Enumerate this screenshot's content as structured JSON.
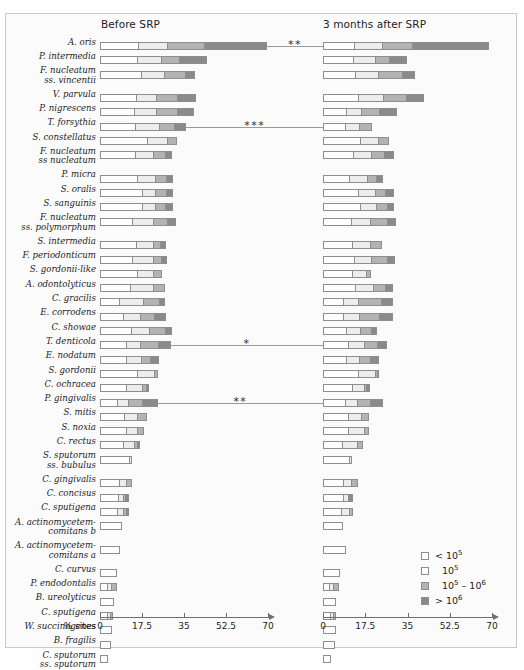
{
  "panels": {
    "before": {
      "title": "Before SRP"
    },
    "after": {
      "title": "3 months after SRP"
    }
  },
  "axis": {
    "caption": "% sites",
    "ticks": [
      "0",
      "17.5",
      "35",
      "52.5",
      "70"
    ],
    "min": 0,
    "max": 70
  },
  "legend": {
    "items": [
      {
        "name": "lt-10e5",
        "swatch": "#ffffff",
        "prefix": "<",
        "base": "10",
        "exp": "5"
      },
      {
        "name": "10e5",
        "swatch": "#ffffff",
        "prefix": "",
        "base": "10",
        "exp": "5"
      },
      {
        "name": "10e5-10e6",
        "swatch": "#b3b3b3",
        "prefix": "",
        "base": "10",
        "exp": "5",
        "base2": "10",
        "exp2": "6",
        "dash": "–"
      },
      {
        "name": "gt-10e6",
        "swatch": "#8a8a8a",
        "prefix": ">",
        "base": "10",
        "exp": "6"
      }
    ]
  },
  "chart_data": {
    "type": "bar",
    "orientation": "horizontal",
    "stacked": true,
    "xlabel": "% sites",
    "ylabel": "",
    "xlim": [
      0,
      70
    ],
    "xticks": [
      0,
      17.5,
      35,
      52.5,
      70
    ],
    "grid": false,
    "legend_position": "bottom-right",
    "series": [
      {
        "name": "< 10^5",
        "color": "#ffffff"
      },
      {
        "name": "10^5",
        "color": "#ededed"
      },
      {
        "name": "10^5 - 10^6",
        "color": "#b3b3b3"
      },
      {
        "name": "> 10^6",
        "color": "#8a8a8a"
      }
    ],
    "rows": [
      {
        "label": "A. oris",
        "label2": "",
        "before": [
          16.0,
          12.0,
          15.5,
          26.0
        ],
        "after": [
          13.0,
          11.5,
          12.5,
          32.0
        ],
        "stars": 2
      },
      {
        "label": "P. intermedia",
        "label2": "",
        "before": [
          15.5,
          10.0,
          7.5,
          11.5
        ],
        "after": [
          12.5,
          9.0,
          6.0,
          7.5
        ],
        "stars": 0
      },
      {
        "label": "F. nucleatum",
        "label2": "ss. vincentii",
        "before": [
          17.0,
          9.5,
          9.0,
          4.0
        ],
        "after": [
          13.5,
          9.5,
          10.0,
          5.5
        ],
        "stars": 0
      },
      {
        "label": "V. parvula",
        "label2": "",
        "before": [
          15.0,
          8.5,
          8.5,
          8.0
        ],
        "after": [
          14.5,
          10.5,
          9.5,
          7.5
        ],
        "stars": 0
      },
      {
        "label": "P. nigrescens",
        "label2": "",
        "before": [
          14.0,
          9.5,
          8.5,
          7.0
        ],
        "after": [
          9.5,
          6.5,
          7.5,
          7.5
        ],
        "stars": 0
      },
      {
        "label": "T. forsythia",
        "label2": "",
        "before": [
          14.5,
          10.0,
          6.5,
          5.0
        ],
        "after": [
          9.0,
          6.0,
          5.5,
          0.0
        ],
        "stars": 3
      },
      {
        "label": "S. constellatus",
        "label2": "",
        "before": [
          19.5,
          8.5,
          4.0,
          0.0
        ],
        "after": [
          15.5,
          7.5,
          4.5,
          0.0
        ],
        "stars": 0
      },
      {
        "label": "F. nucleatum",
        "label2": "ss nucleatum",
        "before": [
          14.5,
          7.5,
          5.0,
          3.0
        ],
        "after": [
          12.5,
          7.5,
          5.5,
          4.0
        ],
        "stars": 0
      },
      {
        "label": "P. micra",
        "label2": "",
        "before": [
          15.5,
          7.5,
          4.5,
          3.0
        ],
        "after": [
          11.0,
          7.5,
          3.5,
          3.0
        ],
        "stars": 0
      },
      {
        "label": "S. oralis",
        "label2": "",
        "before": [
          17.5,
          5.5,
          4.5,
          3.0
        ],
        "after": [
          14.5,
          7.0,
          4.5,
          3.5
        ],
        "stars": 0
      },
      {
        "label": "S. sanguinis",
        "label2": "",
        "before": [
          17.5,
          5.5,
          4.0,
          3.5
        ],
        "after": [
          15.5,
          6.5,
          4.5,
          3.0
        ],
        "stars": 0
      },
      {
        "label": "F. nucleatum",
        "label2": "ss. polymorphum",
        "before": [
          13.5,
          8.5,
          6.0,
          3.5
        ],
        "after": [
          11.5,
          8.0,
          7.0,
          4.0
        ],
        "stars": 0
      },
      {
        "label": "S. intermedia",
        "label2": "",
        "before": [
          15.0,
          7.0,
          3.0,
          2.5
        ],
        "after": [
          12.0,
          7.5,
          5.0,
          0.0
        ],
        "stars": 0
      },
      {
        "label": "F. periodonticum",
        "label2": "",
        "before": [
          13.5,
          8.5,
          3.5,
          2.5
        ],
        "after": [
          13.0,
          7.0,
          6.5,
          3.5
        ],
        "stars": 0
      },
      {
        "label": "S. gordonii-like",
        "label2": "",
        "before": [
          15.5,
          6.5,
          4.0,
          0.0
        ],
        "after": [
          12.0,
          6.0,
          2.0,
          0.0
        ],
        "stars": 0
      },
      {
        "label": "A. odontolyticus",
        "label2": "",
        "before": [
          12.5,
          9.5,
          5.0,
          0.0
        ],
        "after": [
          13.5,
          7.5,
          5.0,
          3.0
        ],
        "stars": 0
      },
      {
        "label": "C. gracilis",
        "label2": "",
        "before": [
          8.0,
          10.0,
          6.5,
          2.5
        ],
        "after": [
          8.5,
          6.0,
          9.5,
          5.0
        ],
        "stars": 0
      },
      {
        "label": "E. corrodens",
        "label2": "",
        "before": [
          9.5,
          7.0,
          6.0,
          5.0
        ],
        "after": [
          8.5,
          6.5,
          8.5,
          5.5
        ],
        "stars": 0
      },
      {
        "label": "C. showae",
        "label2": "",
        "before": [
          13.0,
          7.5,
          6.5,
          3.0
        ],
        "after": [
          9.5,
          6.0,
          4.5,
          2.5
        ],
        "stars": 0
      },
      {
        "label": "T. denticola",
        "label2": "",
        "before": [
          11.0,
          5.5,
          7.5,
          5.5
        ],
        "after": [
          10.5,
          6.5,
          5.5,
          4.0
        ],
        "stars": 1
      },
      {
        "label": "E. nodatum",
        "label2": "",
        "before": [
          11.0,
          6.0,
          4.0,
          3.5
        ],
        "after": [
          9.5,
          5.5,
          4.5,
          4.0
        ],
        "stars": 0
      },
      {
        "label": "S. gordonii",
        "label2": "",
        "before": [
          15.5,
          7.0,
          1.5,
          0.0
        ],
        "after": [
          14.5,
          7.0,
          1.0,
          1.0
        ],
        "stars": 0
      },
      {
        "label": "C. ochracea",
        "label2": "",
        "before": [
          11.0,
          6.5,
          1.5,
          1.5
        ],
        "after": [
          12.0,
          5.0,
          1.0,
          1.5
        ],
        "stars": 0
      },
      {
        "label": "P. gingivalis",
        "label2": "",
        "before": [
          7.0,
          4.5,
          6.0,
          6.5
        ],
        "after": [
          9.0,
          5.0,
          5.5,
          5.5
        ],
        "stars": 2
      },
      {
        "label": "S. mitis",
        "label2": "",
        "before": [
          10.0,
          5.5,
          4.0,
          0.0
        ],
        "after": [
          10.5,
          5.5,
          3.0,
          0.0
        ],
        "stars": 0
      },
      {
        "label": "S. noxia",
        "label2": "",
        "before": [
          11.0,
          4.5,
          3.0,
          0.0
        ],
        "after": [
          10.5,
          6.5,
          2.0,
          0.0
        ],
        "stars": 0
      },
      {
        "label": "C. rectus",
        "label2": "",
        "before": [
          9.5,
          4.5,
          1.5,
          1.0
        ],
        "after": [
          8.0,
          6.0,
          2.5,
          0.0
        ],
        "stars": 0
      },
      {
        "label": "S. sputorum",
        "label2": "ss. bubulus",
        "before": [
          12.0,
          1.5,
          0.0,
          0.0
        ],
        "after": [
          11.0,
          1.0,
          0.0,
          0.0
        ],
        "stars": 0
      },
      {
        "label": "C. gingivalis",
        "label2": "",
        "before": [
          8.0,
          3.0,
          2.5,
          0.0
        ],
        "after": [
          8.5,
          3.0,
          3.0,
          0.0
        ],
        "stars": 0
      },
      {
        "label": "C. concisus",
        "label2": "",
        "before": [
          7.5,
          2.0,
          1.0,
          1.5
        ],
        "after": [
          8.5,
          2.0,
          0.5,
          1.5
        ],
        "stars": 0
      },
      {
        "label": "C. sputigena",
        "label2": "",
        "before": [
          7.0,
          2.5,
          1.5,
          1.0
        ],
        "after": [
          7.5,
          3.5,
          1.5,
          0.0
        ],
        "stars": 0
      },
      {
        "label": "A. actinomycetem-",
        "label2": "comitans b",
        "before": [
          9.0,
          0.0,
          0.0,
          0.0
        ],
        "after": [
          8.5,
          0.0,
          0.0,
          0.0
        ],
        "stars": 0
      },
      {
        "label": "A. actinomycetem-",
        "label2": "comitans a",
        "before": [
          8.5,
          0.0,
          0.0,
          0.0
        ],
        "after": [
          9.5,
          0.0,
          0.0,
          0.0
        ],
        "stars": 0
      },
      {
        "label": "C. curvus",
        "label2": "",
        "before": [
          7.0,
          0.0,
          0.0,
          0.0
        ],
        "after": [
          7.0,
          0.0,
          0.0,
          0.0
        ],
        "stars": 0
      },
      {
        "label": "P. endodontalis",
        "label2": "",
        "before": [
          3.0,
          1.5,
          2.5,
          0.0
        ],
        "after": [
          2.5,
          1.5,
          2.5,
          0.0
        ],
        "stars": 0
      },
      {
        "label": "B. ureolyticus",
        "label2": "",
        "before": [
          6.0,
          0.0,
          0.0,
          0.0
        ],
        "after": [
          5.5,
          0.0,
          0.0,
          0.0
        ],
        "stars": 0
      },
      {
        "label": "C. sputigena",
        "label2": "",
        "before": [
          3.0,
          1.0,
          1.5,
          0.0
        ],
        "after": [
          3.0,
          1.0,
          1.5,
          0.0
        ],
        "stars": 0
      },
      {
        "label": "W. succinogenes",
        "label2": "",
        "before": [
          5.0,
          0.0,
          0.0,
          0.0
        ],
        "after": [
          5.5,
          0.0,
          0.0,
          0.0
        ],
        "stars": 0
      },
      {
        "label": "B. fragilis",
        "label2": "",
        "before": [
          4.5,
          0.0,
          0.0,
          0.0
        ],
        "after": [
          5.0,
          0.0,
          0.0,
          0.0
        ],
        "stars": 0
      },
      {
        "label": "C. sputorum",
        "label2": "ss. sputorum",
        "before": [
          3.5,
          0.0,
          0.0,
          0.0
        ],
        "after": [
          3.5,
          0.0,
          0.0,
          0.0
        ],
        "stars": 0
      }
    ]
  }
}
